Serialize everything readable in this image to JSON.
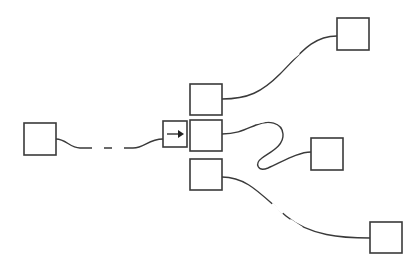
{
  "diagram": {
    "background_color": "#ffffff",
    "stroke_color": "#3a3a3a",
    "node_fill": "#ffffff",
    "canvas": {
      "width": 420,
      "height": 272
    },
    "nodes": [
      {
        "id": "source-left",
        "label": "",
        "x": 24,
        "y": 123,
        "width": 32,
        "height": 32,
        "kind": "empty-box"
      },
      {
        "id": "arrow-gate",
        "label": "",
        "x": 163,
        "y": 121,
        "width": 24,
        "height": 26,
        "kind": "arrow-box",
        "glyph": "right-arrow"
      },
      {
        "id": "hub-top",
        "label": "",
        "x": 190,
        "y": 84,
        "width": 32,
        "height": 31,
        "kind": "empty-box"
      },
      {
        "id": "hub-middle",
        "label": "",
        "x": 190,
        "y": 120,
        "width": 32,
        "height": 31,
        "kind": "empty-box"
      },
      {
        "id": "hub-bottom",
        "label": "",
        "x": 190,
        "y": 159,
        "width": 32,
        "height": 31,
        "kind": "empty-box"
      },
      {
        "id": "target-top-right",
        "label": "",
        "x": 337,
        "y": 18,
        "width": 32,
        "height": 32,
        "kind": "empty-box"
      },
      {
        "id": "target-mid-right",
        "label": "",
        "x": 311,
        "y": 138,
        "width": 32,
        "height": 32,
        "kind": "empty-box"
      },
      {
        "id": "target-bot-right",
        "label": "",
        "x": 370,
        "y": 222,
        "width": 32,
        "height": 31,
        "kind": "empty-box"
      }
    ],
    "links": [
      {
        "id": "link-source-to-gate",
        "from": "source-left",
        "to": "arrow-gate",
        "style": "wavy-dashed-middle",
        "path": "M 56 139 C 66 139 70 148 80 148 C 92 148 96 148 106 148 C 118 148 122 148 133 148 C 145 148 148 139 163 139",
        "dash_mask": "M 92 148 L 104 148 M 112 148 L 124 148"
      },
      {
        "id": "link-hubtop-to-topright",
        "from": "hub-top",
        "to": "target-top-right",
        "style": "s-curve-dashed-middle",
        "path": "M 222 99 C 248 99 262 92 280 74 C 300 54 312 36 337 36",
        "dash_mask": "M 268 80 L 280 70 M 288 62 L 299 53"
      },
      {
        "id": "link-hubmid-to-midright",
        "from": "hub-middle",
        "to": "target-mid-right",
        "style": "loop-dashed-top",
        "path": "M 222 134 C 238 134 246 129 256 125 C 268 120 282 122 283 134 C 284 146 270 152 262 158 C 254 164 258 172 268 168 C 282 162 298 152 311 152",
        "dash_mask": "M 256 123 L 268 120 M 274 120 L 282 125"
      },
      {
        "id": "link-hubbot-to-botright",
        "from": "hub-bottom",
        "to": "target-bot-right",
        "style": "s-curve-dashed-middle",
        "path": "M 222 177 C 248 177 262 196 286 216 C 310 236 342 238 370 238",
        "dash_mask": "M 272 204 L 283 213 M 290 220 L 302 228"
      }
    ],
    "arrow_glyph": {
      "name": "right-arrow",
      "line": {
        "x1": 167,
        "y1": 134,
        "x2": 181,
        "y2": 134
      },
      "head": "178,130 184,134 178,138"
    }
  }
}
